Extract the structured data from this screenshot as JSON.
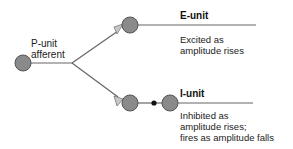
{
  "diagram": {
    "afferent": {
      "line1": "P-unit",
      "line2": "afferent"
    },
    "e_unit": {
      "title": "E-unit",
      "desc_line1": "Excited as",
      "desc_line2": "amplitude rises"
    },
    "i_unit": {
      "title": "I-unit",
      "desc_line1": "Inhibited as",
      "desc_line2": "amplitude rises;",
      "desc_line3": "fires as amplitude falls"
    },
    "colors": {
      "neuron_fill": "#8a8a8a",
      "neuron_stroke": "#555555",
      "line": "#666666",
      "synapse_fill": "#c8c8c8",
      "text": "#222222"
    }
  }
}
